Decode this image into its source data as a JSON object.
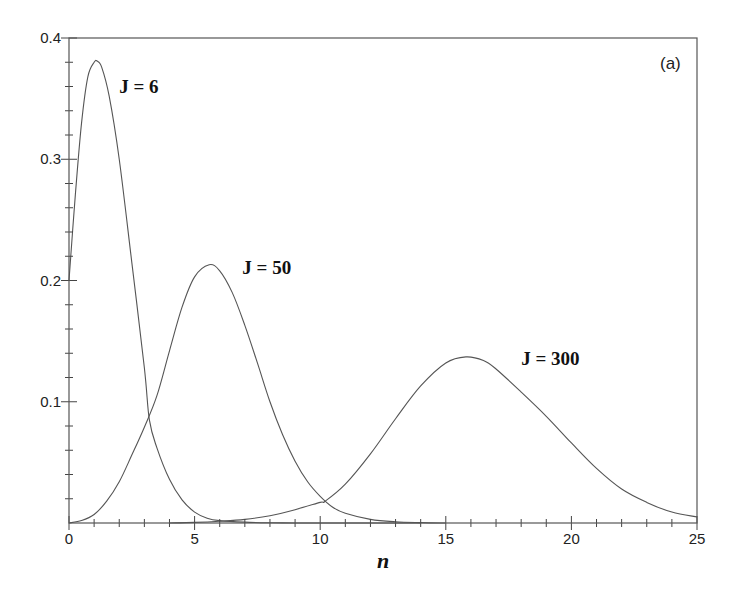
{
  "chart_data": {
    "type": "line",
    "title": "",
    "panel_label": "(a)",
    "xlabel": "n",
    "ylabel": "",
    "xlim": [
      0,
      25
    ],
    "ylim": [
      0,
      0.4
    ],
    "grid": false,
    "legend": "none (inline curve labels)",
    "x_ticks": [
      0,
      5,
      10,
      15,
      20,
      25
    ],
    "x_tick_labels": [
      "0",
      "5",
      "10",
      "15",
      "20",
      "25"
    ],
    "x_minor_step": 1,
    "y_ticks": [
      0.1,
      0.2,
      0.3,
      0.4
    ],
    "y_tick_labels": [
      "0.1",
      "0.2",
      "0.3",
      "0.4"
    ],
    "y_minor_step": 0.02,
    "series": [
      {
        "name": "J = 6",
        "label_pos": [
          2.0,
          0.355
        ],
        "peak": [
          1.12,
          0.381
        ],
        "x": [
          0,
          0.25,
          0.5,
          0.75,
          1.0,
          1.12,
          1.3,
          1.6,
          2.0,
          2.5,
          3.0,
          3.2,
          3.5,
          4.0,
          4.5,
          5.0,
          5.5,
          6.0,
          7.0,
          8.0,
          9.0,
          10.0,
          11.0,
          12.0,
          13.0,
          14.0
        ],
        "y": [
          0.2,
          0.27,
          0.33,
          0.368,
          0.38,
          0.381,
          0.376,
          0.352,
          0.3,
          0.215,
          0.128,
          0.085,
          0.062,
          0.036,
          0.019,
          0.009,
          0.004,
          0.002,
          0.0007,
          0.0002,
          6e-05,
          2e-05,
          0.0,
          0.0,
          0.0,
          0.0
        ]
      },
      {
        "name": "J = 50",
        "label_pos": [
          6.9,
          0.205
        ],
        "peak": [
          5.58,
          0.213
        ],
        "x": [
          0,
          0.5,
          1.0,
          1.5,
          2.0,
          2.5,
          3.0,
          3.5,
          4.0,
          4.5,
          5.0,
          5.58,
          6.0,
          6.5,
          7.0,
          7.5,
          8.0,
          8.5,
          9.0,
          9.5,
          10.0,
          10.5,
          11.0,
          12.0,
          13.0,
          14.0,
          15.0
        ],
        "y": [
          0.0,
          0.002,
          0.007,
          0.018,
          0.034,
          0.056,
          0.079,
          0.105,
          0.142,
          0.178,
          0.203,
          0.213,
          0.208,
          0.19,
          0.163,
          0.132,
          0.1,
          0.073,
          0.051,
          0.034,
          0.022,
          0.013,
          0.008,
          0.003,
          0.001,
          0.0003,
          0.0
        ]
      },
      {
        "name": "J = 300",
        "label_pos": [
          18.0,
          0.13
        ],
        "peak": [
          15.8,
          0.137
        ],
        "x": [
          4,
          5,
          6,
          7,
          8,
          9,
          10,
          10.2,
          11,
          12,
          13,
          14,
          15,
          15.8,
          16.5,
          17,
          18,
          19,
          20,
          21,
          22,
          23,
          24,
          25
        ],
        "y": [
          0.0,
          0.0005,
          0.0015,
          0.003,
          0.006,
          0.011,
          0.017,
          0.018,
          0.032,
          0.057,
          0.086,
          0.113,
          0.132,
          0.137,
          0.134,
          0.127,
          0.108,
          0.088,
          0.066,
          0.045,
          0.028,
          0.017,
          0.009,
          0.005
        ]
      }
    ]
  }
}
